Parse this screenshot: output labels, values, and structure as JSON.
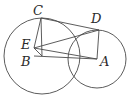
{
  "figure": {
    "background_color": "#ffffff",
    "stroke_color": "#4a4a4a",
    "label_color": "#2b2b2b",
    "labels": [
      {
        "id": "C",
        "text": "C",
        "x": 33,
        "y": 4
      },
      {
        "id": "D",
        "text": "D",
        "x": 91,
        "y": 12
      },
      {
        "id": "E",
        "text": "E",
        "x": 21,
        "y": 38
      },
      {
        "id": "B",
        "text": "B",
        "x": 21,
        "y": 55
      },
      {
        "id": "A",
        "text": "A",
        "x": 100,
        "y": 55
      }
    ],
    "circles": [
      {
        "id": "circle-B",
        "name": "left-circle",
        "cx": 42,
        "cy": 56,
        "r": 38
      },
      {
        "id": "circle-A",
        "name": "right-circle",
        "cx": 97,
        "cy": 59,
        "r": 29
      }
    ],
    "points": {
      "C": {
        "x": 41,
        "y": 18
      },
      "D": {
        "x": 99,
        "y": 30
      },
      "E": {
        "x": 34,
        "y": 48
      },
      "B": {
        "x": 42,
        "y": 56
      },
      "A": {
        "x": 97,
        "y": 59
      }
    },
    "segments": [
      {
        "id": "seg-CD",
        "name": "segment-c-d",
        "from": "C",
        "to": "D"
      },
      {
        "id": "seg-CE",
        "name": "segment-c-e",
        "from": "C",
        "to": "E"
      },
      {
        "id": "seg-ED",
        "name": "segment-e-d",
        "from": "E",
        "to": "D"
      },
      {
        "id": "seg-EA",
        "name": "segment-e-a",
        "from": "E",
        "to": "A"
      },
      {
        "id": "seg-CB",
        "name": "segment-c-b",
        "from": "C",
        "to": "B"
      },
      {
        "id": "seg-DA",
        "name": "segment-d-a",
        "from": "D",
        "to": "A"
      },
      {
        "id": "seg-EB",
        "name": "segment-e-b",
        "from": "E",
        "to": "B"
      },
      {
        "id": "seg-BA",
        "name": "segment-b-a",
        "from": "B",
        "to": "A"
      }
    ]
  }
}
